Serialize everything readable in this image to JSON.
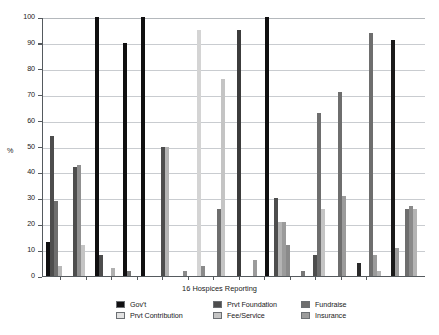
{
  "chart_data": {
    "type": "bar",
    "title": "",
    "xlabel": "16 Hospices Reporting",
    "ylabel": "%",
    "ylim": [
      0,
      100
    ],
    "ytick_step": 10,
    "yticks": [
      0,
      10,
      20,
      30,
      40,
      50,
      60,
      70,
      80,
      90,
      100
    ],
    "grid": true,
    "legend_position": "bottom",
    "categories": [
      "Hospice 1",
      "Hospice 2",
      "Hospice 3",
      "Hospice 4",
      "Hospice 5",
      "Hospice 6",
      "Hospice 7",
      "Hospice 8",
      "Hospice 9",
      "Hospice 10",
      "Hospice 11",
      "Hospice 12",
      "Hospice 13",
      "Hospice 14",
      "Hospice 15",
      "Hospice 16"
    ],
    "series": [
      {
        "name": "Gov't",
        "color": "#100f10",
        "values": [
          13,
          0,
          100,
          90,
          0,
          100,
          0,
          0,
          0,
          0,
          100,
          0,
          0,
          8,
          0,
          0
        ]
      },
      {
        "name": "Prvt Contribution",
        "color": "#e2e2e2",
        "values": [
          0,
          0,
          0,
          0,
          0,
          0,
          0,
          95,
          0,
          0,
          0,
          0,
          0,
          0,
          0,
          0
        ]
      },
      {
        "name": "Prvt Foundation",
        "color": "#4d4d4d",
        "values": [
          54,
          42,
          0,
          8,
          0,
          0,
          50,
          0,
          26,
          0,
          0,
          30,
          26,
          0,
          0,
          0
        ]
      },
      {
        "name": "Fee/Service",
        "color": "#c4c4c4",
        "values": [
          0,
          43,
          0,
          0,
          0,
          0,
          50,
          76,
          0,
          0,
          0,
          21,
          0,
          0,
          0,
          26
        ]
      },
      {
        "name": "Fundraise",
        "color": "#6e6e6e",
        "values": [
          29,
          0,
          0,
          0,
          0,
          0,
          0,
          0,
          0,
          95,
          0,
          21,
          63,
          71,
          31,
          26
        ]
      },
      {
        "name": "Insurance",
        "color": "#9b9b9b",
        "values": [
          4,
          12,
          0,
          3,
          0,
          0,
          0,
          0,
          0,
          0,
          0,
          12,
          0,
          0,
          0,
          0
        ]
      }
    ],
    "extra_bars": [
      {
        "group": 9,
        "series": "Prvt Foundation",
        "value": 95
      },
      {
        "group": 13,
        "series": "Fundraise",
        "value": 71
      },
      {
        "group": 14,
        "series": "Fundraise",
        "value": 94
      },
      {
        "group": 15,
        "series": "Gov't",
        "value": 91
      }
    ]
  },
  "axes": {
    "y_title": "%",
    "x_title": "16 Hospices Reporting",
    "y_labels": [
      "100",
      "90",
      "80",
      "70",
      "60",
      "50",
      "40",
      "30",
      "20",
      "10",
      "0"
    ]
  },
  "legend": {
    "entries": [
      {
        "label": "Gov't",
        "color": "#100f10"
      },
      {
        "label": "Prvt Foundation",
        "color": "#4d4d4d"
      },
      {
        "label": "Fundraise",
        "color": "#6e6e6e"
      },
      {
        "label": "Prvt Contribution",
        "color": "#e2e2e2"
      },
      {
        "label": "Fee/Service",
        "color": "#c4c4c4"
      },
      {
        "label": "Insurance",
        "color": "#9b9b9b"
      }
    ]
  },
  "bars": [
    {
      "x": 45,
      "h": 13,
      "c": "#100f10"
    },
    {
      "x": 49,
      "h": 54,
      "c": "#4d4d4d"
    },
    {
      "x": 53,
      "h": 29,
      "c": "#6e6e6e"
    },
    {
      "x": 57,
      "h": 4,
      "c": "#b8b8b8"
    },
    {
      "x": 72,
      "h": 42,
      "c": "#4d4d4d"
    },
    {
      "x": 76,
      "h": 43,
      "c": "#909090"
    },
    {
      "x": 80,
      "h": 12,
      "c": "#c4c4c4"
    },
    {
      "x": 94,
      "h": 100,
      "c": "#100f10"
    },
    {
      "x": 98,
      "h": 8,
      "c": "#4d4d4d"
    },
    {
      "x": 110,
      "h": 3,
      "c": "#b0b0b0"
    },
    {
      "x": 122,
      "h": 90,
      "c": "#100f10"
    },
    {
      "x": 126,
      "h": 2,
      "c": "#777777"
    },
    {
      "x": 140,
      "h": 100,
      "c": "#100f10"
    },
    {
      "x": 160,
      "h": 50,
      "c": "#4d4d4d"
    },
    {
      "x": 164,
      "h": 50,
      "c": "#b4b4b4"
    },
    {
      "x": 182,
      "h": 2,
      "c": "#8a8a8a"
    },
    {
      "x": 196,
      "h": 95,
      "c": "#d4d4d4"
    },
    {
      "x": 200,
      "h": 4,
      "c": "#8a8a8a"
    },
    {
      "x": 216,
      "h": 26,
      "c": "#6e6e6e"
    },
    {
      "x": 220,
      "h": 76,
      "c": "#c4c4c4"
    },
    {
      "x": 236,
      "h": 95,
      "c": "#3c3c3c"
    },
    {
      "x": 252,
      "h": 6,
      "c": "#9b9b9b"
    },
    {
      "x": 264,
      "h": 100,
      "c": "#100f10"
    },
    {
      "x": 273,
      "h": 30,
      "c": "#4d4d4d"
    },
    {
      "x": 277,
      "h": 21,
      "c": "#b4b4b4"
    },
    {
      "x": 281,
      "h": 21,
      "c": "#9b9b9b"
    },
    {
      "x": 285,
      "h": 12,
      "c": "#8a8a8a"
    },
    {
      "x": 300,
      "h": 2,
      "c": "#777777"
    },
    {
      "x": 312,
      "h": 8,
      "c": "#4d4d4d"
    },
    {
      "x": 316,
      "h": 63,
      "c": "#6e6e6e"
    },
    {
      "x": 320,
      "h": 26,
      "c": "#c4c4c4"
    },
    {
      "x": 337,
      "h": 71,
      "c": "#6e6e6e"
    },
    {
      "x": 341,
      "h": 31,
      "c": "#9b9b9b"
    },
    {
      "x": 356,
      "h": 5,
      "c": "#2a2a2a"
    },
    {
      "x": 368,
      "h": 94,
      "c": "#6e6e6e"
    },
    {
      "x": 372,
      "h": 8,
      "c": "#9b9b9b"
    },
    {
      "x": 376,
      "h": 2,
      "c": "#b4b4b4"
    },
    {
      "x": 390,
      "h": 91,
      "c": "#1a1a1a"
    },
    {
      "x": 394,
      "h": 11,
      "c": "#9b9b9b"
    },
    {
      "x": 404,
      "h": 26,
      "c": "#6e6e6e"
    },
    {
      "x": 408,
      "h": 27,
      "c": "#8a8a8a"
    },
    {
      "x": 412,
      "h": 26,
      "c": "#b4b4b4"
    }
  ],
  "x_ticks": [
    59,
    85,
    110,
    136,
    161,
    187,
    212,
    238,
    263,
    289,
    314,
    340,
    365
  ]
}
